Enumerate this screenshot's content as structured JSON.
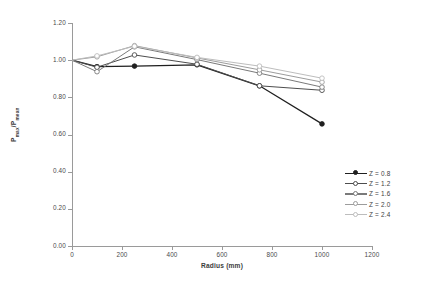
{
  "chart_data": {
    "type": "line",
    "title": "",
    "xlabel": "Radius (mm)",
    "ylabel": "Pmax/Pmean",
    "xlim": [
      0,
      1200
    ],
    "ylim": [
      0.0,
      1.2
    ],
    "x_ticks": [
      0,
      200,
      400,
      600,
      800,
      1000,
      1200
    ],
    "y_ticks": [
      "0.00",
      "0.20",
      "0.40",
      "0.60",
      "0.80",
      "1.00",
      "1.20"
    ],
    "grid": false,
    "legend_position": "right-bottom",
    "x": [
      0,
      100,
      250,
      500,
      750,
      1000
    ],
    "series": [
      {
        "name": "Z = 0.8",
        "color": "#1f1f1f",
        "values": [
          1.0,
          0.965,
          0.968,
          0.975,
          0.862,
          0.657
        ]
      },
      {
        "name": "Z = 1.2",
        "color": "#4d4d4d",
        "values": [
          1.0,
          0.962,
          1.028,
          0.978,
          0.862,
          0.838
        ]
      },
      {
        "name": "Z = 1.6",
        "color": "#7a7a7a",
        "values": [
          1.0,
          0.938,
          1.072,
          1.003,
          0.93,
          0.855
        ]
      },
      {
        "name": "Z = 2.0",
        "color": "#9c9c9c",
        "values": [
          1.0,
          1.018,
          1.078,
          1.012,
          0.948,
          0.882
        ]
      },
      {
        "name": "Z = 2.4",
        "color": "#bdbdbd",
        "values": [
          1.0,
          1.023,
          1.075,
          1.015,
          0.968,
          0.903
        ]
      }
    ]
  },
  "axes": {
    "x_title": "Radius (mm)",
    "y_title": "Pmax/Pmean",
    "y_title_parts": {
      "num": "P",
      "num_sub": "max",
      "den": "P",
      "den_sub": "mean"
    }
  },
  "legend": {
    "entries": [
      "Z = 0.8",
      "Z = 1.2",
      "Z = 1.6",
      "Z = 2.0",
      "Z = 2.4"
    ]
  }
}
